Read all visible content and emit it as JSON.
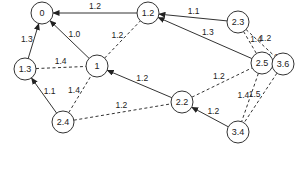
{
  "diagram": {
    "sink_label": "sink",
    "nodes": [
      {
        "id": "n0",
        "label": "0",
        "x": 42,
        "y": 13
      },
      {
        "id": "n12",
        "label": "1.2",
        "x": 148,
        "y": 13
      },
      {
        "id": "n23",
        "label": "2.3",
        "x": 238,
        "y": 22
      },
      {
        "id": "n13",
        "label": "1.3",
        "x": 25,
        "y": 69
      },
      {
        "id": "n1",
        "label": "1",
        "x": 97,
        "y": 66
      },
      {
        "id": "n25",
        "label": "2.5",
        "x": 262,
        "y": 63
      },
      {
        "id": "n36",
        "label": "3.6",
        "x": 283,
        "y": 64
      },
      {
        "id": "n24",
        "label": "2.4",
        "x": 63,
        "y": 122
      },
      {
        "id": "n22",
        "label": "2.2",
        "x": 182,
        "y": 102
      },
      {
        "id": "n34",
        "label": "3.4",
        "x": 238,
        "y": 132
      }
    ],
    "edges": [
      {
        "from": "n12",
        "to": "n0",
        "label": "1.2",
        "style": "solid"
      },
      {
        "from": "n23",
        "to": "n12",
        "label": "1.1",
        "style": "solid"
      },
      {
        "from": "n13",
        "to": "n0",
        "label": "1.3",
        "style": "solid"
      },
      {
        "from": "n1",
        "to": "n0",
        "label": "1.0",
        "style": "solid"
      },
      {
        "from": "n1",
        "to": "n12",
        "label": "1.2",
        "style": "dashed"
      },
      {
        "from": "n13",
        "to": "n1",
        "label": "1.4",
        "style": "dashed"
      },
      {
        "from": "n25",
        "to": "n12",
        "label": "1.3",
        "style": "solid"
      },
      {
        "from": "n23",
        "to": "n25",
        "label": "1.4",
        "style": "dashed"
      },
      {
        "from": "n23",
        "to": "n36",
        "label": "1.2",
        "style": "dashed"
      },
      {
        "from": "n36",
        "to": "n25",
        "label": "1.1",
        "style": "solid"
      },
      {
        "from": "n24",
        "to": "n13",
        "label": "1.1",
        "style": "solid"
      },
      {
        "from": "n24",
        "to": "n1",
        "label": "1.4",
        "style": "dashed"
      },
      {
        "from": "n22",
        "to": "n1",
        "label": "1.2",
        "style": "solid"
      },
      {
        "from": "n22",
        "to": "n25",
        "label": "1.2",
        "style": "dashed"
      },
      {
        "from": "n24",
        "to": "n22",
        "label": "1.2",
        "style": "dashed"
      },
      {
        "from": "n25",
        "to": "n34",
        "label": "1.4",
        "style": "dashed"
      },
      {
        "from": "n36",
        "to": "n34",
        "label": "1.5",
        "style": "dashed"
      },
      {
        "from": "n34",
        "to": "n22",
        "label": "1.2",
        "style": "solid"
      }
    ]
  }
}
